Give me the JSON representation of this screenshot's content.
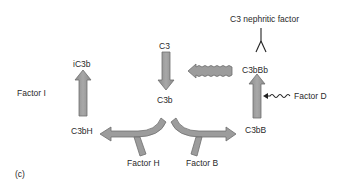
{
  "diagram": {
    "panel_label": "(c)",
    "nodes": {
      "c3": "C3",
      "c3b": "C3b",
      "ic3b": "iC3b",
      "c3bh": "C3bH",
      "c3bb": "C3bB",
      "c3bbb": "C3bBb"
    },
    "factors": {
      "factor_i": "Factor I",
      "factor_h": "Factor H",
      "factor_b": "Factor B",
      "factor_d": "Factor D",
      "c3_nephritic_factor": "C3 nephritic factor"
    },
    "edges": [
      {
        "from": "C3",
        "to": "C3b",
        "style": "block-arrow"
      },
      {
        "from": "C3b",
        "to": "C3bH",
        "via": "Factor H",
        "style": "curved-branch-arrow"
      },
      {
        "from": "C3b",
        "to": "C3bB",
        "via": "Factor B",
        "style": "curved-branch-arrow"
      },
      {
        "from": "C3bH",
        "to": "iC3b",
        "via": "Factor I",
        "style": "block-arrow"
      },
      {
        "from": "C3bB",
        "to": "C3bBb",
        "via": "Factor D",
        "style": "block-arrow"
      },
      {
        "from": "C3bBb",
        "to": "C3",
        "style": "wavy-block-arrow"
      },
      {
        "from": "Factor D",
        "to": "C3bB-arrow",
        "style": "squiggle-arrow"
      },
      {
        "from": "C3 nephritic factor",
        "to": "C3bBb",
        "style": "antibody-Y"
      }
    ],
    "colors": {
      "arrow_fill": "#9a9a9a",
      "arrow_stroke": "#6e6e6e",
      "text": "#2a2a2a",
      "background": "#ffffff"
    }
  }
}
